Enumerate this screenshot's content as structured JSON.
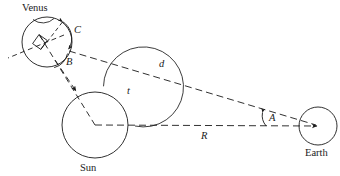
{
  "figure": {
    "type": "astronomy-geometry-diagram",
    "stroke_color": "#1a1a1a",
    "background_color": "#ffffff"
  },
  "bodies": {
    "venus": {
      "label": "Venus"
    },
    "sun": {
      "label": "Sun"
    },
    "earth": {
      "label": "Earth"
    }
  },
  "measures": {
    "distance_venus_earth": "d",
    "distance_sun_earth": "R",
    "angle_at_earth": "A",
    "angle_at_venus_lower": "B",
    "angle_at_venus_upper": "C",
    "arc_at_sun": "t"
  },
  "cut_off_header_text": "g  y,  p  pp  g"
}
